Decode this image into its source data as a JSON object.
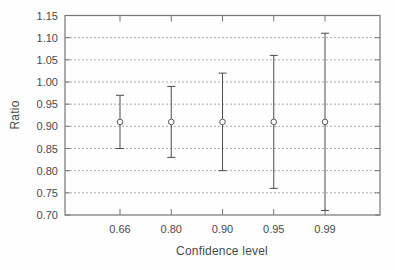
{
  "chart_data": {
    "type": "scatter",
    "subtype": "errorbar",
    "title": "",
    "xlabel": "Confidence level",
    "ylabel": "Ratio",
    "categories": [
      "0.66",
      "0.80",
      "0.90",
      "0.95",
      "0.99"
    ],
    "series": [
      {
        "name": "ratio",
        "values": [
          0.91,
          0.91,
          0.91,
          0.91,
          0.91
        ],
        "error_low": [
          0.85,
          0.83,
          0.8,
          0.76,
          0.71
        ],
        "error_high": [
          0.97,
          0.99,
          1.02,
          1.06,
          1.11
        ]
      }
    ],
    "ylim": [
      0.7,
      1.15
    ],
    "ytick_step": 0.05,
    "ytick_labels": [
      "0.70",
      "0.75",
      "0.80",
      "0.85",
      "0.90",
      "0.95",
      "1.00",
      "1.05",
      "1.10",
      "1.15"
    ],
    "grid": "horizontal-dashed",
    "legend": "none",
    "marker": "open-circle"
  },
  "colors": {
    "background": "#fefefe",
    "axis": "#767676",
    "grid": "#ababab",
    "errorbar": "#4d4d4d",
    "marker": "#5a5a5a",
    "text": "#4a4a4a"
  }
}
